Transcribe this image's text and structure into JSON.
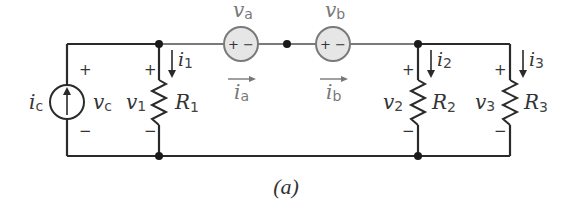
{
  "caption": "(a)",
  "colors": {
    "wire": "#2a2a2a",
    "wire_gray": "#7a7a7a",
    "source_fill": "#e6e6e6",
    "text": "#333333"
  },
  "current_source": {
    "current": {
      "sym": "i",
      "sub": "c"
    },
    "voltage": {
      "sym": "v",
      "sub": "c"
    },
    "plus": "+",
    "minus": "−"
  },
  "voltage_sources": [
    {
      "voltage": {
        "sym": "v",
        "sub": "a"
      },
      "current": {
        "sym": "i",
        "sub": "a"
      },
      "polarity": "+ −"
    },
    {
      "voltage": {
        "sym": "v",
        "sub": "b"
      },
      "current": {
        "sym": "i",
        "sub": "b"
      },
      "polarity": "+ −"
    }
  ],
  "resistors": [
    {
      "name": {
        "sym": "R",
        "sub": "1"
      },
      "voltage": {
        "sym": "v",
        "sub": "1"
      },
      "current": {
        "sym": "i",
        "sub": "1"
      },
      "plus": "+",
      "minus": "−"
    },
    {
      "name": {
        "sym": "R",
        "sub": "2"
      },
      "voltage": {
        "sym": "v",
        "sub": "2"
      },
      "current": {
        "sym": "i",
        "sub": "2"
      },
      "plus": "+",
      "minus": "−"
    },
    {
      "name": {
        "sym": "R",
        "sub": "3"
      },
      "voltage": {
        "sym": "v",
        "sub": "3"
      },
      "current": {
        "sym": "i",
        "sub": "3"
      },
      "plus": "+",
      "minus": "−"
    }
  ]
}
